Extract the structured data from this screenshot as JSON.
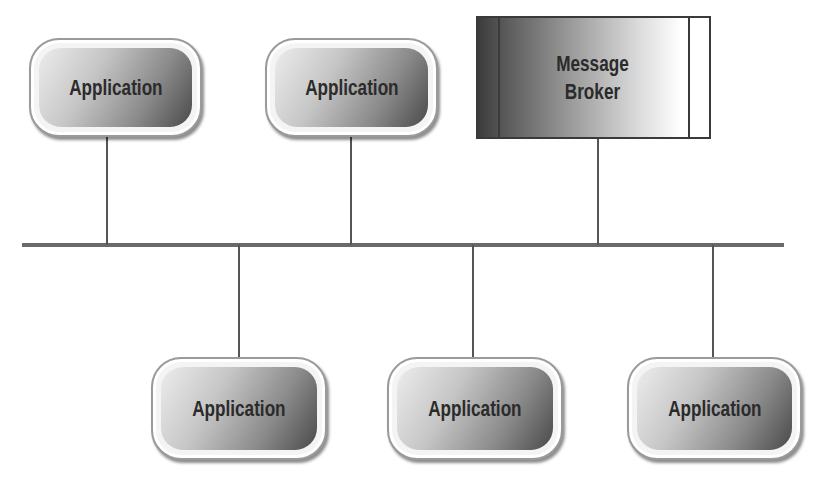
{
  "diagram": {
    "type": "bus-topology",
    "bus": {
      "label": ""
    },
    "broker": {
      "line1": "Message",
      "line2": "Broker"
    },
    "top_nodes": [
      {
        "label": "Application"
      },
      {
        "label": "Application"
      }
    ],
    "bottom_nodes": [
      {
        "label": "Application"
      },
      {
        "label": "Application"
      },
      {
        "label": "Application"
      }
    ],
    "colors": {
      "line": "#555555",
      "node_dark": "#4a4a4a",
      "node_light": "#ececec",
      "text": "#2b2b2b"
    }
  }
}
